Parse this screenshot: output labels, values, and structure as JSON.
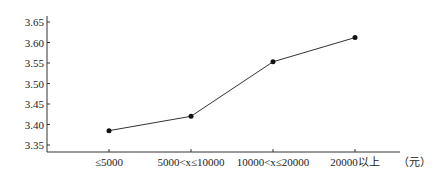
{
  "chart_data": {
    "type": "line",
    "title": "",
    "xlabel": "",
    "ylabel": "",
    "x_unit_label": "（元）",
    "categories": [
      "≤5000",
      "5000<x≤10000",
      "10000<x≤20000",
      "20000以上"
    ],
    "series": [
      {
        "name": "",
        "values": [
          3.385,
          3.42,
          3.553,
          3.612
        ]
      }
    ],
    "yticks": [
      3.35,
      3.4,
      3.45,
      3.5,
      3.55,
      3.6,
      3.65
    ],
    "ytick_labels": [
      "3.35",
      "3.40",
      "3.45",
      "3.50",
      "3.55",
      "3.60",
      "3.65"
    ],
    "ylim": [
      3.33,
      3.665
    ],
    "grid": false,
    "legend": "none"
  }
}
